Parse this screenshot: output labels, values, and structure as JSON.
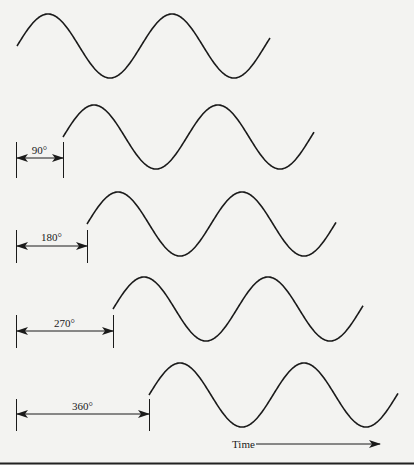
{
  "figure": {
    "stroke_color": "#1a1a1a",
    "background_color": "#f3f3f1",
    "bottom_border_color": "#222222"
  },
  "waves": [
    {
      "phase_label": "",
      "start_x": 17,
      "center_y": 46,
      "end_x": 270
    },
    {
      "phase_label": "90°",
      "start_x": 63,
      "center_y": 137,
      "end_x": 314
    },
    {
      "phase_label": "180°",
      "start_x": 87,
      "center_y": 224,
      "end_x": 336
    },
    {
      "phase_label": "270°",
      "start_x": 113,
      "center_y": 309,
      "end_x": 363
    },
    {
      "phase_label": "360°",
      "start_x": 149,
      "center_y": 395,
      "end_x": 398
    }
  ],
  "wave_params": {
    "amplitude": 32,
    "period": 124
  },
  "dimension_markers": [
    {
      "label": "90°",
      "left_x": 16,
      "right_x": 63,
      "tick_top": 142,
      "tick_bottom": 178,
      "arrow_y": 158,
      "label_y": 154
    },
    {
      "label": "180°",
      "left_x": 16,
      "right_x": 87,
      "tick_top": 230,
      "tick_bottom": 263,
      "arrow_y": 246,
      "label_y": 241
    },
    {
      "label": "270°",
      "left_x": 16,
      "right_x": 113,
      "tick_top": 315,
      "tick_bottom": 348,
      "arrow_y": 331,
      "label_y": 327
    },
    {
      "label": "360°",
      "left_x": 16,
      "right_x": 149,
      "tick_top": 399,
      "tick_bottom": 431,
      "arrow_y": 414,
      "label_y": 410
    }
  ],
  "time_axis": {
    "label": "Time",
    "label_x": 232,
    "label_y": 448,
    "arrow_start_x": 256,
    "arrow_end_x": 380,
    "arrow_y": 444
  }
}
